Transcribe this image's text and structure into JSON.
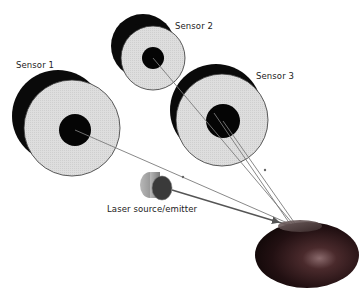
{
  "labels": {
    "sensor1": "Sensor 1",
    "sensor2": "Sensor 2",
    "sensor3": "Sensor 3",
    "emitter": "Laser source/emitter"
  },
  "colors": {
    "sensor_face": "#dcdcdc",
    "sensor_body": "#0a0a0a",
    "beam": "#7a7a7a",
    "emitter_beam": "#555555",
    "emitter_body": "#9a9a9a",
    "emitter_face": "#3a3a3a",
    "sample": "#2a1214"
  }
}
